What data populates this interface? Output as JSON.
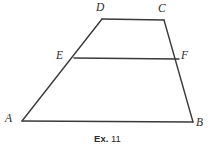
{
  "figure": {
    "background_color": "#ffffff",
    "stroke_color": "#3a3a3a",
    "stroke_width": 1.4,
    "labels": {
      "A": "A",
      "B": "B",
      "C": "C",
      "D": "D",
      "E": "E",
      "F": "F"
    },
    "caption": {
      "prefix": "Ex.",
      "number": "11",
      "full": "Ex. 11"
    },
    "points": {
      "A": {
        "x": 22,
        "y": 121
      },
      "B": {
        "x": 193,
        "y": 122
      },
      "C": {
        "x": 164,
        "y": 20
      },
      "D": {
        "x": 102,
        "y": 19
      },
      "E": {
        "x": 74,
        "y": 58
      },
      "F": {
        "x": 179,
        "y": 59
      }
    },
    "segments": [
      {
        "name": "side-AB",
        "from": "A",
        "to": "B"
      },
      {
        "name": "side-BC",
        "from": "B",
        "to": "C"
      },
      {
        "name": "side-CD",
        "from": "C",
        "to": "D"
      },
      {
        "name": "side-DA",
        "from": "D",
        "to": "A"
      },
      {
        "name": "midsegment-EF",
        "from": "E",
        "to": "F"
      }
    ]
  }
}
